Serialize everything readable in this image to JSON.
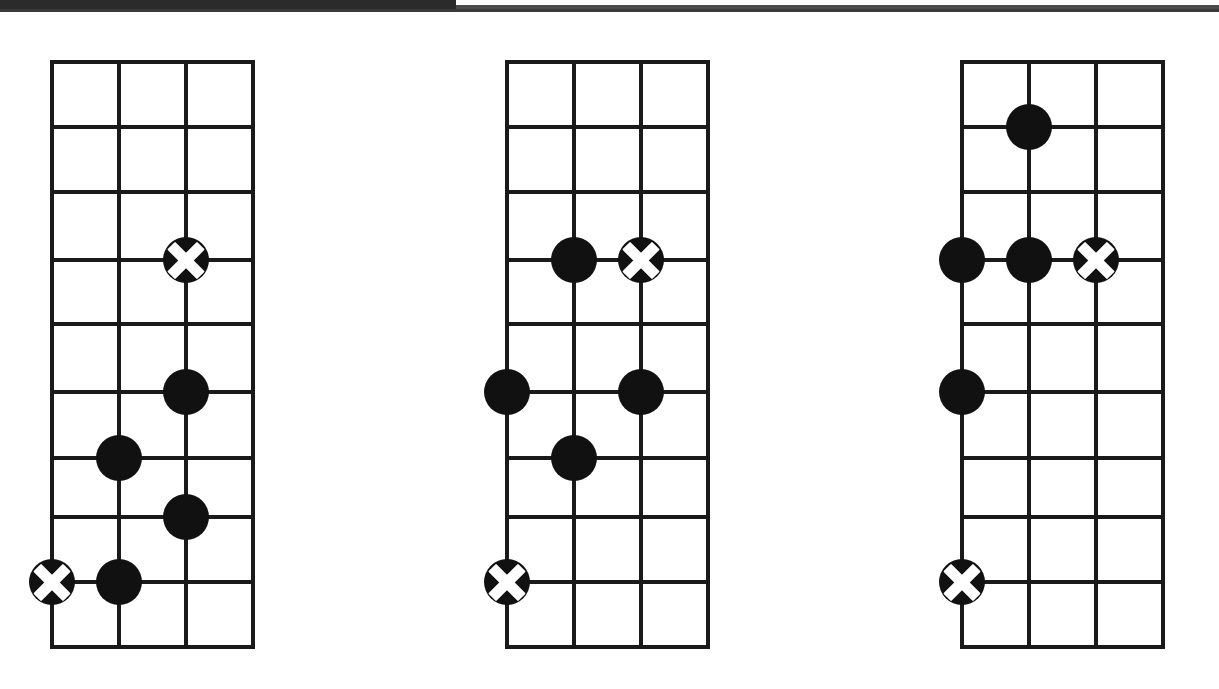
{
  "page": {
    "background_color": "#ffffff",
    "ink_color": "#1a1a1a",
    "marker_fill_color": "#111111",
    "root_cross_color": "#ffffff",
    "artifact": {
      "thick_bar_color": "#2b2b2b",
      "thin_line_color": "#3a3a3a"
    }
  },
  "chart_data": {
    "type": "diagram",
    "title": "",
    "subtitle": "",
    "xlabel": "",
    "ylabel": "",
    "notation": {
      "filled_circle": "note",
      "circle_with_cross": "root-note"
    },
    "grid": {
      "columns": 3,
      "rows": 8,
      "vertical_lines": 4,
      "horizontal_lines": 9,
      "column_x": [
        0,
        67,
        134,
        201
      ],
      "row_y": [
        0,
        65,
        130,
        198,
        262,
        330,
        396,
        455,
        520,
        585
      ]
    },
    "diagrams": [
      {
        "name": "diagram-1",
        "origin_x": 50,
        "origin_y": 60,
        "markers": [
          {
            "string": 3,
            "fret": 4,
            "type": "root"
          },
          {
            "string": 3,
            "fret": 6,
            "type": "note"
          },
          {
            "string": 2,
            "fret": 7,
            "type": "note"
          },
          {
            "string": 3,
            "fret": 8,
            "type": "note"
          },
          {
            "string": 1,
            "fret": 9,
            "type": "root"
          },
          {
            "string": 2,
            "fret": 9,
            "type": "note"
          }
        ]
      },
      {
        "name": "diagram-2",
        "origin_x": 505,
        "origin_y": 60,
        "markers": [
          {
            "string": 2,
            "fret": 4,
            "type": "note"
          },
          {
            "string": 3,
            "fret": 4,
            "type": "root"
          },
          {
            "string": 1,
            "fret": 6,
            "type": "note"
          },
          {
            "string": 3,
            "fret": 6,
            "type": "note"
          },
          {
            "string": 2,
            "fret": 7,
            "type": "note"
          },
          {
            "string": 1,
            "fret": 9,
            "type": "root"
          }
        ]
      },
      {
        "name": "diagram-3",
        "origin_x": 960,
        "origin_y": 60,
        "markers": [
          {
            "string": 2,
            "fret": 2,
            "type": "note"
          },
          {
            "string": 1,
            "fret": 4,
            "type": "note"
          },
          {
            "string": 2,
            "fret": 4,
            "type": "note"
          },
          {
            "string": 3,
            "fret": 4,
            "type": "root"
          },
          {
            "string": 1,
            "fret": 6,
            "type": "note"
          },
          {
            "string": 1,
            "fret": 9,
            "type": "root"
          }
        ]
      }
    ]
  }
}
